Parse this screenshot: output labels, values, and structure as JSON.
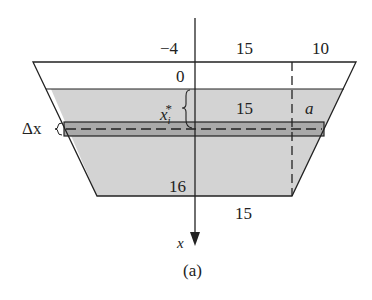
{
  "diagram": {
    "caption": "(a)",
    "labels": {
      "top_left": "−4",
      "top_mid": "15",
      "top_right": "10",
      "zero": "0",
      "xi_star": "x",
      "xi_sub": "i",
      "xi_sup": "*",
      "water_mid": "15",
      "a": "a",
      "delta_x": "Δx",
      "bottom_depth": "16",
      "bottom_width": "15",
      "axis": "x"
    },
    "colors": {
      "fill": "#d3d3d3",
      "strip": "#a9a9a9",
      "stroke": "#222222"
    }
  }
}
